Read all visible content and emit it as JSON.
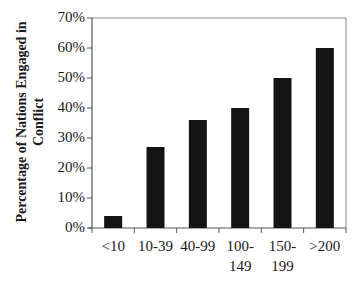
{
  "chart_data": {
    "type": "bar",
    "title": "",
    "xlabel": "",
    "ylabel": "Percentage of Nations Engaged in Conflict",
    "ylabel_lines": [
      "Percentage of Nations Engaged in",
      "Conflict"
    ],
    "categories": [
      "<10",
      "10-39",
      "40-99",
      "100-149",
      "150-199",
      ">200"
    ],
    "category_lines": [
      [
        "<10"
      ],
      [
        "10-39"
      ],
      [
        "40-99"
      ],
      [
        "100-",
        "149"
      ],
      [
        "150-",
        "199"
      ],
      [
        ">200"
      ]
    ],
    "values": [
      4,
      27,
      36,
      40,
      50,
      60
    ],
    "value_unit": "%",
    "ylim": [
      0,
      70
    ],
    "yticks": [
      "0%",
      "10%",
      "20%",
      "30%",
      "40%",
      "50%",
      "60%",
      "70%"
    ],
    "grid": false,
    "legend": null,
    "bar_color": "#141414",
    "axis_color": "#555555"
  }
}
